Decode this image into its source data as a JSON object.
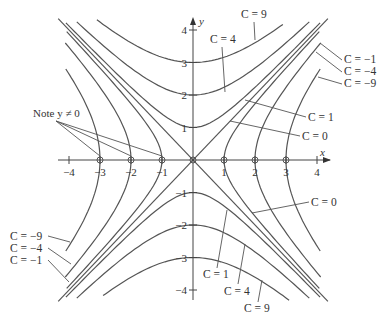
{
  "figure": {
    "colors": {
      "curve": "#555555",
      "axis": "#444444",
      "text": "#333333",
      "background": "#ffffff"
    },
    "axes": {
      "x_label": "x",
      "y_label": "y",
      "x_ticks": [
        {
          "value": -4,
          "label": "−4"
        },
        {
          "value": -3,
          "label": "−3"
        },
        {
          "value": -2,
          "label": "−2"
        },
        {
          "value": -1,
          "label": "−1"
        },
        {
          "value": 1,
          "label": "1"
        },
        {
          "value": 2,
          "label": "2"
        },
        {
          "value": 3,
          "label": "3"
        },
        {
          "value": 4,
          "label": "4"
        }
      ],
      "y_ticks": [
        {
          "value": 4,
          "label": "4"
        },
        {
          "value": 3,
          "label": "3"
        },
        {
          "value": 2,
          "label": "2"
        },
        {
          "value": 1,
          "label": "1"
        },
        {
          "value": -1,
          "label": "−1"
        },
        {
          "value": -2,
          "label": "−2"
        },
        {
          "value": -3,
          "label": "−3"
        },
        {
          "value": -4,
          "label": "−4"
        }
      ]
    },
    "note": {
      "text": "Note y ≠ 0",
      "points": [
        -3,
        -2,
        -1
      ]
    },
    "labels": {
      "top": [
        {
          "text": "C = 9",
          "C": 9
        },
        {
          "text": "C = 4",
          "C": 4
        },
        {
          "text": "C = 1",
          "C": 1
        },
        {
          "text": "C = 0",
          "C": 0
        }
      ],
      "right": [
        {
          "text": "C = −1",
          "C": -1
        },
        {
          "text": "C = −4",
          "C": -4
        },
        {
          "text": "C = −9",
          "C": -9
        }
      ],
      "left": [
        {
          "text": "C = −9",
          "C": -9
        },
        {
          "text": "C = −4",
          "C": -4
        },
        {
          "text": "C = −1",
          "C": -1
        }
      ],
      "bottom": [
        {
          "text": "C = 0",
          "C": 0
        },
        {
          "text": "C = 1",
          "C": 1
        },
        {
          "text": "C = 4",
          "C": 4
        },
        {
          "text": "C = 9",
          "C": 9
        }
      ]
    }
  },
  "chart_data": {
    "type": "line",
    "title": "",
    "equation": "y^2 - x^2 = C",
    "xlabel": "x",
    "ylabel": "y",
    "xlim": [
      -4.4,
      4.4
    ],
    "ylim": [
      -4.4,
      4.4
    ],
    "grid": false,
    "legend": "inline labels with leader lines",
    "series": [
      {
        "name": "C = 9",
        "C": 9,
        "kind": "vertical-hyperbola",
        "vertices": [
          [
            0,
            3
          ],
          [
            0,
            -3
          ]
        ],
        "x_range": [
          -3.1,
          2.9
        ]
      },
      {
        "name": "C = 4",
        "C": 4,
        "kind": "vertical-hyperbola",
        "vertices": [
          [
            0,
            2
          ],
          [
            0,
            -2
          ]
        ],
        "x_range": [
          -3.75,
          3.75
        ]
      },
      {
        "name": "C = 1",
        "C": 1,
        "kind": "vertical-hyperbola",
        "vertices": [
          [
            0,
            1
          ],
          [
            0,
            -1
          ]
        ],
        "x_range": [
          -4.1,
          4.1
        ]
      },
      {
        "name": "C = 0",
        "C": 0,
        "kind": "lines",
        "equations": [
          "y = x",
          "y = -x"
        ],
        "x_range": [
          -4.35,
          4.35
        ]
      },
      {
        "name": "C = -1",
        "C": -1,
        "kind": "horizontal-hyperbola",
        "vertices": [
          [
            1,
            0
          ],
          [
            -1,
            0
          ]
        ],
        "y_range": [
          -3.95,
          3.95
        ]
      },
      {
        "name": "C = -4",
        "C": -4,
        "kind": "horizontal-hyperbola",
        "vertices": [
          [
            2,
            0
          ],
          [
            -2,
            0
          ]
        ],
        "y_range": [
          -3.6,
          3.6
        ]
      },
      {
        "name": "C = -9",
        "C": -9,
        "kind": "horizontal-hyperbola",
        "vertices": [
          [
            3,
            0
          ],
          [
            -3,
            0
          ]
        ],
        "y_range": [
          -2.8,
          2.8
        ]
      }
    ],
    "excluded_points": [
      [
        -3,
        0
      ],
      [
        -2,
        0
      ],
      [
        -1,
        0
      ],
      [
        1,
        0
      ],
      [
        2,
        0
      ],
      [
        3,
        0
      ],
      [
        0,
        0
      ]
    ],
    "annotations": [
      "Note y ≠ 0"
    ]
  }
}
